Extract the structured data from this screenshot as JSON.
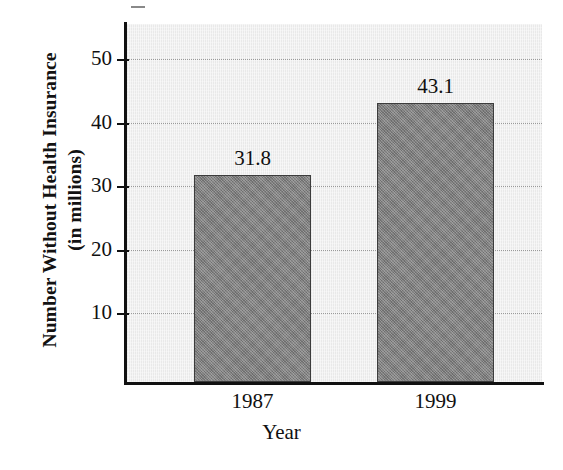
{
  "chart_data": {
    "type": "bar",
    "title": "",
    "subtitle": "",
    "xlabel": "Year",
    "ylabel": "Number Without Health Insurance",
    "ylabel_line2": "(in millions)",
    "categories": [
      "1987",
      "1999"
    ],
    "values": [
      31.8,
      43.1
    ],
    "value_labels": [
      "31.8",
      "43.1"
    ],
    "ylim": [
      0,
      56
    ],
    "y_ticks": [
      10,
      20,
      30,
      40,
      50
    ],
    "y_tick_labels": [
      "10",
      "20",
      "30",
      "40",
      "50"
    ],
    "grid": "horizontal-dotted",
    "legend": "none",
    "series": [
      {
        "name": "Number Without Health Insurance",
        "values": [
          31.8,
          43.1
        ]
      }
    ]
  },
  "colors": {
    "bar_fill": "#828282",
    "bar_edge": "#3c3c3c",
    "plot_background": "#e9e9e9",
    "page_background": "#ffffff",
    "axis": "#111111",
    "gridline": "#9a9a9a",
    "text": "#101010"
  }
}
